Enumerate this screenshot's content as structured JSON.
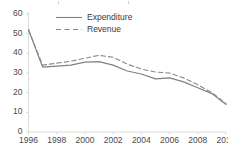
{
  "chart_data": {
    "type": "line",
    "title": "",
    "subtitle": "",
    "xlabel": "",
    "ylabel": "",
    "x": [
      1996,
      1997,
      1998,
      1999,
      2000,
      2001,
      2002,
      2003,
      2004,
      2005,
      2006,
      2007,
      2008,
      2009,
      2010
    ],
    "xlim": [
      1996,
      2010
    ],
    "ylim": [
      0,
      60
    ],
    "x_tick_labels": [
      "1996",
      "1998",
      "2000",
      "2002",
      "2004",
      "2006",
      "2008",
      "2010"
    ],
    "x_tick_values": [
      1996,
      1998,
      2000,
      2002,
      2004,
      2006,
      2008,
      2010
    ],
    "y_tick_labels": [
      "0",
      "10",
      "20",
      "30",
      "40",
      "50",
      "60"
    ],
    "y_tick_values": [
      0,
      10,
      20,
      30,
      40,
      50,
      60
    ],
    "grid": false,
    "legend_position": "top-left",
    "series": [
      {
        "name": "Expenditure",
        "style": "solid",
        "color": "#808080",
        "values": [
          52.0,
          33.0,
          33.5,
          34.0,
          35.5,
          35.8,
          34.0,
          31.0,
          29.5,
          27.0,
          27.5,
          25.5,
          22.5,
          19.5,
          14.0
        ]
      },
      {
        "name": "Revenue",
        "style": "dashed",
        "color": "#8a8a8a",
        "values": [
          52.0,
          34.0,
          35.0,
          36.0,
          37.5,
          39.0,
          38.0,
          34.5,
          32.0,
          30.5,
          30.0,
          27.5,
          24.0,
          20.0,
          14.5
        ]
      }
    ]
  },
  "legend": {
    "items": [
      {
        "label": "Expenditure",
        "style": "solid"
      },
      {
        "label": "Revenue",
        "style": "dashed"
      }
    ]
  },
  "axes": {
    "axis_color": "#d8d8d8",
    "tick_color": "#4a4a4a"
  }
}
